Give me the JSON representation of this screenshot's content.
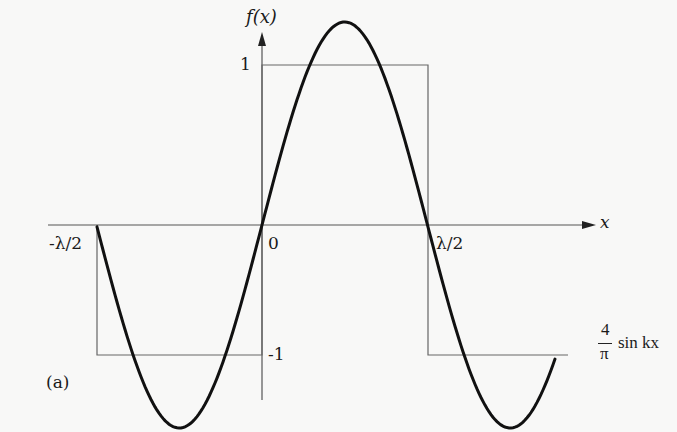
{
  "chart_data": {
    "type": "line",
    "title": "",
    "panel_label": "(a)",
    "xlabel": "x",
    "ylabel": "f(x)",
    "x_ticks": [
      "-λ/2",
      "0",
      "λ/2"
    ],
    "y_ticks": [
      "1",
      "-1"
    ],
    "grid": false,
    "legend": [],
    "annotation": {
      "numerator": "4",
      "denominator": "π",
      "text": "sin kx"
    },
    "series": [
      {
        "name": "square wave f(x)",
        "style": "thin line",
        "x": [
          "-λ/2",
          "-λ/2",
          "0",
          "0",
          "λ/2",
          "λ/2",
          "beyond"
        ],
        "values": [
          0,
          -1,
          -1,
          1,
          1,
          -1,
          -1
        ]
      },
      {
        "name": "(4/π) sin kx",
        "style": "thick line",
        "x_phase_range": [
          "-λ/2",
          "≈0.85λ"
        ],
        "amplitude": 1.273,
        "values_at": {
          "-λ/2": 0,
          "-λ/4": -1.273,
          "0": 0,
          "λ/4": 1.273,
          "λ/2": 0,
          "3λ/4": -1.273
        }
      }
    ]
  }
}
